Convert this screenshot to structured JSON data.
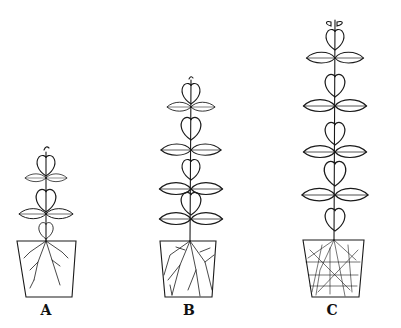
{
  "figure": {
    "colors": {
      "line": "#1a1a1a",
      "background": "#ffffff"
    },
    "plants": [
      {
        "id": "A",
        "label": "A",
        "leaf_pairs": 2,
        "root_density": "sparse"
      },
      {
        "id": "B",
        "label": "B",
        "leaf_pairs": 4,
        "root_density": "moderate"
      },
      {
        "id": "C",
        "label": "C",
        "leaf_pairs": 4,
        "root_density": "dense"
      }
    ]
  }
}
